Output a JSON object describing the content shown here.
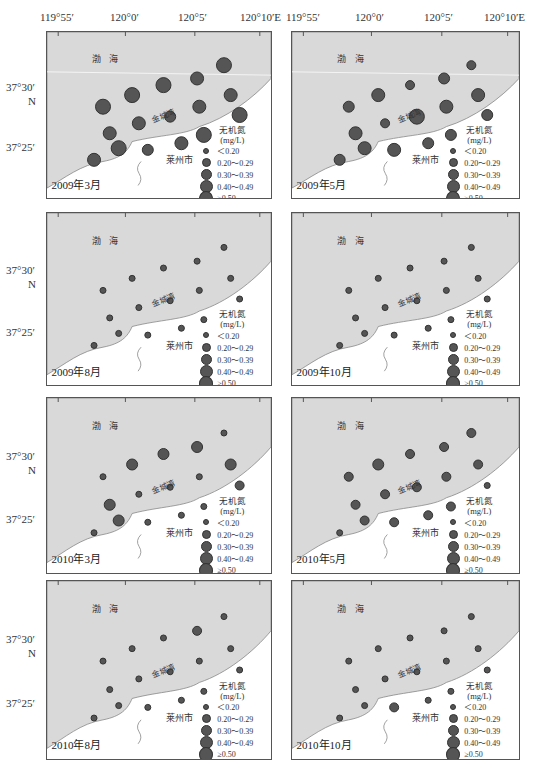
{
  "figure": {
    "x_axis_ticks": [
      "119°55′",
      "120°0′",
      "120°5′",
      "120°10′E"
    ],
    "y_axis_ticks": [
      "37°30′",
      "37°25′"
    ],
    "y_axis_unit": "N",
    "sea_label": "渤 海",
    "bay_label": "金城湾",
    "city_label": "莱州市",
    "legend": {
      "title_line1": "无机氮",
      "title_line2": "(mg/L)",
      "items": [
        {
          "label": "＜0.20",
          "size": 4
        },
        {
          "label": "0.20～0.29",
          "size": 7
        },
        {
          "label": "0.30～0.39",
          "size": 9
        },
        {
          "label": "0.40～0.49",
          "size": 11
        },
        {
          "label": "≥0.50",
          "size": 13
        }
      ]
    },
    "colors": {
      "sea": "#d9d9d9",
      "land": "#ffffff",
      "dot_fill": "#555555",
      "dot_stroke": "#333333",
      "frame": "#555555"
    }
  },
  "panels": [
    {
      "date": "2009年3月",
      "sizes": [
        4,
        4,
        4,
        3,
        4,
        3,
        4,
        3,
        3,
        2,
        3,
        4,
        3,
        2,
        4,
        3
      ]
    },
    {
      "date": "2009年5月",
      "sizes": [
        2,
        3,
        1,
        2,
        1,
        3,
        2,
        3,
        1,
        5,
        3,
        2,
        2,
        3,
        3,
        2
      ]
    },
    {
      "date": "2009年8月",
      "sizes": [
        0,
        0,
        0,
        0,
        0,
        0,
        0,
        0,
        0,
        0,
        0,
        0,
        0,
        0,
        0,
        0
      ]
    },
    {
      "date": "2009年10月",
      "sizes": [
        0,
        0,
        0,
        0,
        0,
        0,
        0,
        0,
        0,
        0,
        0,
        0,
        0,
        0,
        0,
        0
      ]
    },
    {
      "date": "2010年3月",
      "sizes": [
        0,
        2,
        2,
        2,
        0,
        2,
        1,
        2,
        0,
        0,
        0,
        0,
        0,
        0,
        2,
        0
      ]
    },
    {
      "date": "2010年5月",
      "sizes": [
        1,
        2,
        1,
        1,
        1,
        1,
        0,
        1,
        1,
        1,
        1,
        1,
        1,
        1,
        1,
        0
      ]
    },
    {
      "date": "2010年8月",
      "sizes": [
        0,
        0,
        0,
        1,
        0,
        0,
        0,
        0,
        0,
        0,
        0,
        0,
        0,
        0,
        0,
        0
      ]
    },
    {
      "date": "2010年10月",
      "sizes": [
        0,
        0,
        0,
        0,
        0,
        0,
        0,
        0,
        0,
        0,
        0,
        0,
        0,
        1,
        0,
        0
      ]
    }
  ],
  "chart_data": {
    "type": "bubble-map",
    "variable": "无机氮 (mg/L)",
    "size_classes": [
      "<0.20",
      "0.20-0.29",
      "0.30-0.39",
      "0.40-0.49",
      ">=0.50"
    ],
    "x_ticks": [
      "119°55′",
      "120°0′",
      "120°5′",
      "120°10′E"
    ],
    "y_ticks": [
      "37°30′",
      "37°25′"
    ],
    "stations_per_panel": 16,
    "panels": [
      {
        "date": "2009年3月",
        "class_index": [
          4,
          4,
          4,
          3,
          4,
          3,
          4,
          3,
          3,
          2,
          3,
          4,
          3,
          2,
          4,
          3
        ]
      },
      {
        "date": "2009年5月",
        "class_index": [
          2,
          3,
          1,
          2,
          1,
          3,
          2,
          3,
          1,
          4,
          3,
          2,
          2,
          3,
          3,
          2
        ]
      },
      {
        "date": "2009年8月",
        "class_index": [
          0,
          0,
          0,
          0,
          0,
          0,
          0,
          0,
          0,
          0,
          0,
          0,
          0,
          0,
          0,
          0
        ]
      },
      {
        "date": "2009年10月",
        "class_index": [
          0,
          0,
          0,
          0,
          0,
          0,
          0,
          0,
          0,
          0,
          0,
          0,
          0,
          0,
          0,
          0
        ]
      },
      {
        "date": "2010年3月",
        "class_index": [
          0,
          2,
          2,
          2,
          0,
          2,
          1,
          2,
          0,
          0,
          0,
          0,
          0,
          0,
          2,
          0
        ]
      },
      {
        "date": "2010年5月",
        "class_index": [
          1,
          2,
          1,
          1,
          1,
          1,
          0,
          1,
          1,
          1,
          1,
          1,
          1,
          1,
          1,
          0
        ]
      },
      {
        "date": "2010年8月",
        "class_index": [
          0,
          0,
          0,
          1,
          0,
          0,
          0,
          0,
          0,
          0,
          0,
          0,
          0,
          0,
          0,
          0
        ]
      },
      {
        "date": "2010年10月",
        "class_index": [
          0,
          0,
          0,
          0,
          0,
          0,
          0,
          0,
          0,
          0,
          0,
          0,
          0,
          1,
          0,
          0
        ]
      }
    ]
  }
}
